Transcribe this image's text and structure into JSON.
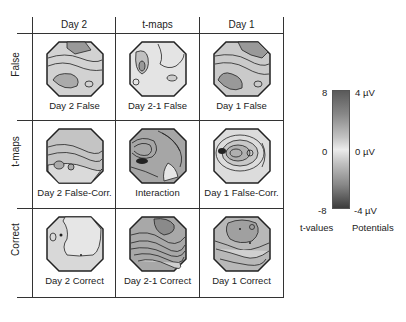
{
  "figure": {
    "columns": [
      "Day 2",
      "t-maps",
      "Day 1"
    ],
    "rows": [
      "False",
      "t-maps",
      "Correct"
    ],
    "cells": [
      {
        "caption": "Day 2 False",
        "fill": "#c8c8c8"
      },
      {
        "caption": "Day 2-1 False",
        "fill": "#dcdcdc"
      },
      {
        "caption": "Day 1 False",
        "fill": "#c0c0c0"
      },
      {
        "caption": "Day 2 False-Corr.",
        "fill": "#bcbcbc"
      },
      {
        "caption": "Interaction",
        "fill": "#9a9a9a"
      },
      {
        "caption": "Day 1 False-Corr.",
        "fill": "#d6d6d6"
      },
      {
        "caption": "Day 2 Correct",
        "fill": "#dadada"
      },
      {
        "caption": "Day 2-1 Correct",
        "fill": "#a4a4a4"
      },
      {
        "caption": "Day 1 Correct",
        "fill": "#b4b4b4"
      }
    ]
  },
  "colorbar": {
    "t_top": "8",
    "t_mid": "0",
    "t_bottom": "-8",
    "p_top": "4 µV",
    "p_mid": "0 µV",
    "p_bottom": "-4 µV",
    "t_label": "t-values",
    "p_label": "Potentials",
    "color_top": "#5a5a5a",
    "color_mid": "#ececec",
    "color_bottom": "#3c3c3c"
  }
}
